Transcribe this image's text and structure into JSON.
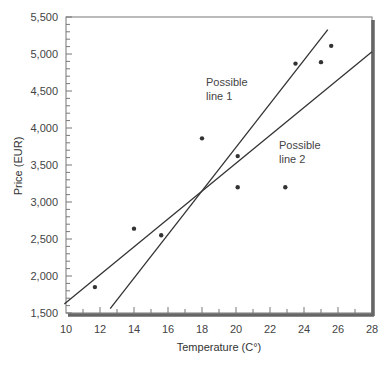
{
  "chart_data": {
    "type": "scatter",
    "title": "",
    "xlabel": "Temperature (C°)",
    "ylabel": "Price (EUR)",
    "xlim": [
      10,
      28
    ],
    "ylim": [
      1500,
      5500
    ],
    "x_ticks": [
      "10",
      "12",
      "14",
      "16",
      "18",
      "20",
      "22",
      "24",
      "26",
      "28"
    ],
    "y_ticks": [
      "1,500",
      "2,000",
      "2,500",
      "3,000",
      "3,500",
      "4,000",
      "4,500",
      "5,000",
      "5,500"
    ],
    "grid": false,
    "series": [
      {
        "name": "Observations",
        "type": "scatter",
        "points": [
          {
            "x": 11.7,
            "y": 1850
          },
          {
            "x": 14.0,
            "y": 2640
          },
          {
            "x": 15.6,
            "y": 2550
          },
          {
            "x": 18.0,
            "y": 3860
          },
          {
            "x": 20.1,
            "y": 3620
          },
          {
            "x": 20.1,
            "y": 3200
          },
          {
            "x": 22.9,
            "y": 3200
          },
          {
            "x": 23.5,
            "y": 4870
          },
          {
            "x": 25.0,
            "y": 4890
          },
          {
            "x": 25.6,
            "y": 5110
          }
        ]
      },
      {
        "name": "Possible line 1",
        "type": "line",
        "points": [
          {
            "x": 12.6,
            "y": 1560
          },
          {
            "x": 25.4,
            "y": 5330
          }
        ]
      },
      {
        "name": "Possible line 2",
        "type": "line",
        "points": [
          {
            "x": 9.9,
            "y": 1620
          },
          {
            "x": 28.0,
            "y": 5030
          }
        ]
      }
    ],
    "annotations": [
      {
        "text": "Possible\nline 1",
        "x": 20.1,
        "y": 4600
      },
      {
        "text": "Possible\nline 2",
        "x": 23.8,
        "y": 3700
      }
    ]
  },
  "labels": {
    "xlabel": "Temperature (C°)",
    "ylabel": "Price (EUR)",
    "annot1_l1": "Possible",
    "annot1_l2": "line 1",
    "annot2_l1": "Possible",
    "annot2_l2": "line 2",
    "x_ticks": [
      "10",
      "12",
      "14",
      "16",
      "18",
      "20",
      "22",
      "24",
      "26",
      "28"
    ],
    "y_ticks": [
      "1,500",
      "2,000",
      "2,500",
      "3,000",
      "3,500",
      "4,000",
      "4,500",
      "5,000",
      "5,500"
    ]
  }
}
